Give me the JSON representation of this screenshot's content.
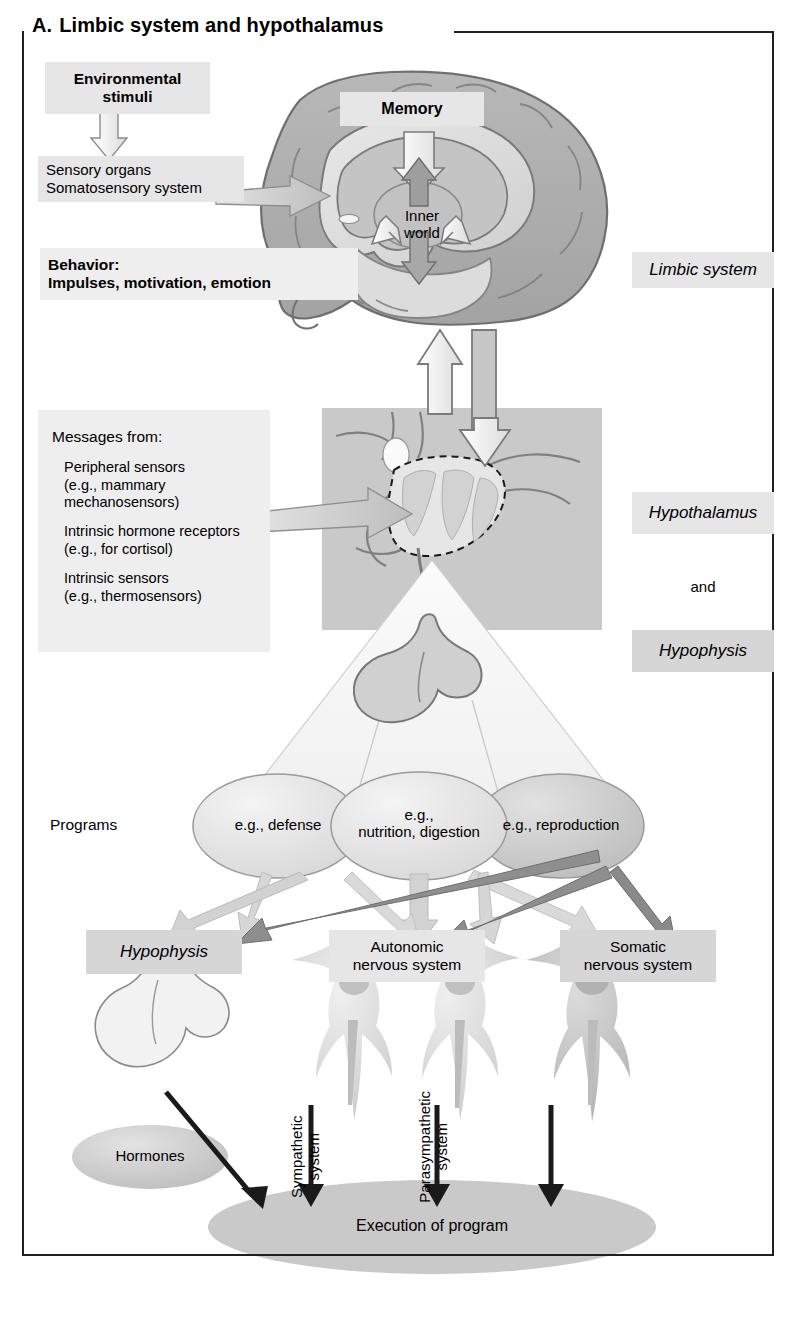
{
  "figure": {
    "letter": "A.",
    "title": "Limbic system and hypothalamus"
  },
  "top_section": {
    "environmental_stimuli": "Environmental\nstimuli",
    "sensory_organs": "Sensory organs\nSomatosensory system",
    "behavior": "Behavior:\nImpulses, motivation, emotion",
    "memory": "Memory",
    "inner_world": "Inner\nworld",
    "limbic_system_label": "Limbic system"
  },
  "middle_section": {
    "messages_heading": "Messages from:",
    "messages_items": [
      "Peripheral sensors\n(e.g., mammary\nmechanosensors)",
      "Intrinsic hormone receptors\n(e.g., for cortisol)",
      "Intrinsic sensors\n(e.g., thermosensors)"
    ],
    "hypothalamus_label": "Hypothalamus",
    "and_label": "and",
    "hypophysis_label": "Hypophysis"
  },
  "programs_section": {
    "label": "Programs",
    "programs": [
      "e.g., defense",
      "e.g.,\nnutrition, digestion",
      "e.g., reproduction"
    ]
  },
  "effector_section": {
    "outputs": [
      "Hypophysis",
      "Autonomic\nnervous system",
      "Somatic\nnervous system"
    ],
    "hormones": "Hormones",
    "sympathetic": "Sympathetic\nsystem",
    "parasympathetic": "Parasympathetic\nsystem",
    "execution": "Execution of program"
  },
  "colors": {
    "frame": "#231f20",
    "box_fill": "#d6d6d6",
    "box_fill_light": "#e6e6e6",
    "brain_outer": "#b3b3b3",
    "brain_inner": "#dcdcdc",
    "arrow_light": "#cfcfcf",
    "arrow_dark": "#8c8c8c",
    "arrow_black": "#1a1a1a",
    "execution_fill": "#c9c9c9"
  }
}
